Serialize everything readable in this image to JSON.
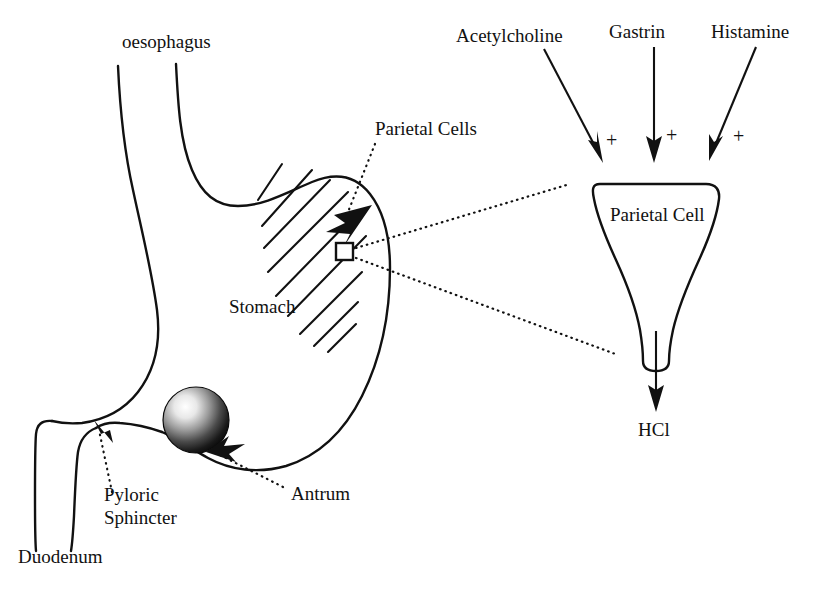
{
  "figure": {
    "background_color": "#ffffff",
    "ink_color": "#111111"
  },
  "labels": {
    "oesophagus": "oesophagus",
    "stomach": "Stomach",
    "parietal_cells": "Parietal Cells",
    "pyloric": "Pyloric",
    "sphincter": "Sphincter",
    "duodenum": "Duodenum",
    "antrum": "Antrum",
    "parietal_cell": "Parietal Cell",
    "hcl": "HCl"
  },
  "stimulants": [
    {
      "name": "Acetylcholine",
      "sign": "+"
    },
    {
      "name": "Gastrin",
      "sign": "+"
    },
    {
      "name": "Histamine",
      "sign": "+"
    }
  ],
  "output": {
    "product": "HCl"
  },
  "annotations": {
    "magnification_source": "parietal-cell-region-marker",
    "leader_style": "dotted"
  }
}
